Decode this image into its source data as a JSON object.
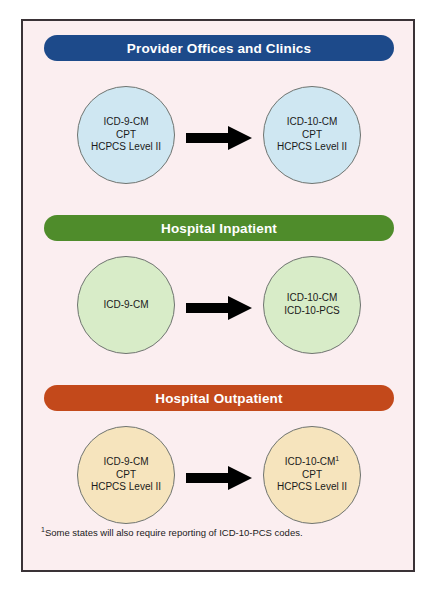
{
  "diagram": {
    "background_color": "#fbeef0",
    "border_color": "#3a3236",
    "sections": [
      {
        "id": "provider-offices-and-clinics",
        "header_label": "Provider Offices and Clinics",
        "header_color": "#1d4a8a",
        "circle_color": "#cfe7f2",
        "from": {
          "lines": [
            "ICD-9-CM",
            "CPT",
            "HCPCS Level II"
          ],
          "footnote_marker": ""
        },
        "to": {
          "lines": [
            "ICD-10-CM",
            "CPT",
            "HCPCS Level II"
          ],
          "footnote_marker": ""
        },
        "connector": "arrow-right-icon"
      },
      {
        "id": "hospital-inpatient",
        "header_label": "Hospital Inpatient",
        "header_color": "#4f8c2b",
        "circle_color": "#d8ecc8",
        "from": {
          "lines": [
            "ICD-9-CM"
          ],
          "footnote_marker": ""
        },
        "to": {
          "lines": [
            "ICD-10-CM",
            "ICD-10-PCS"
          ],
          "footnote_marker": ""
        },
        "connector": "arrow-right-icon"
      },
      {
        "id": "hospital-outpatient",
        "header_label": "Hospital Outpatient",
        "header_color": "#c3491b",
        "circle_color": "#f6e4bd",
        "from": {
          "lines": [
            "ICD-9-CM",
            "CPT",
            "HCPCS Level II"
          ],
          "footnote_marker": ""
        },
        "to": {
          "lines": [
            "ICD-10-CM",
            "CPT",
            "HCPCS Level II"
          ],
          "footnote_marker": "1"
        },
        "connector": "arrow-right-icon"
      }
    ],
    "footnote": {
      "marker": "1",
      "text": "Some states will also require reporting of ICD-10-PCS codes."
    }
  }
}
